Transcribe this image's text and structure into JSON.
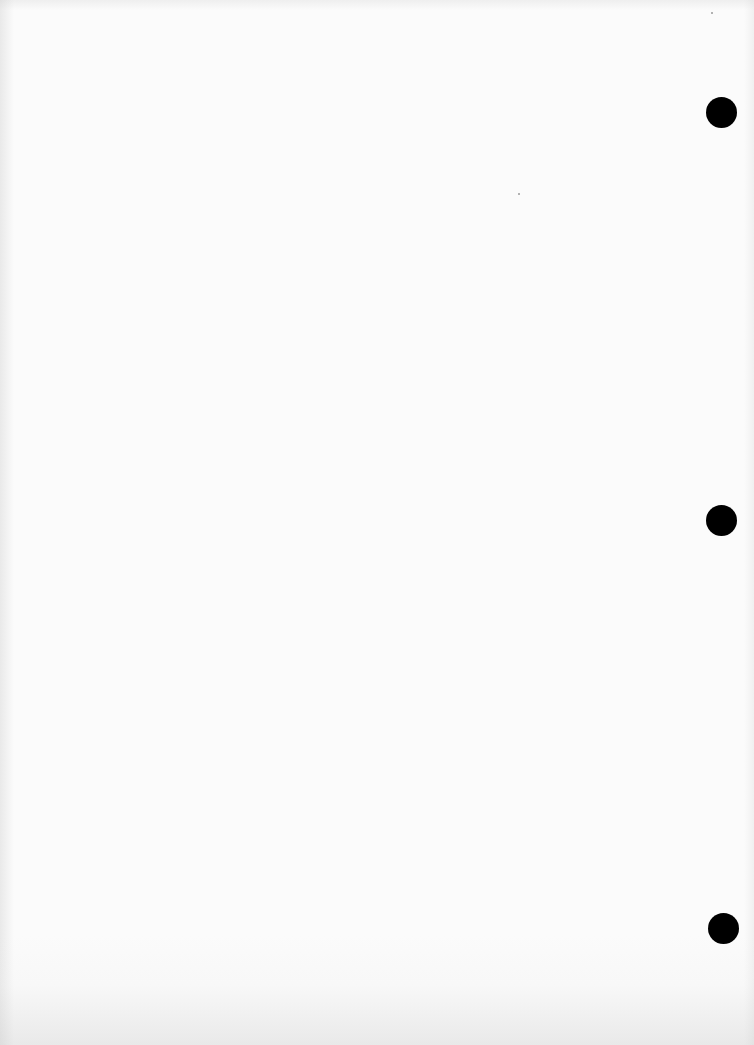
{
  "page": {
    "type": "blank scanned sheet",
    "background_color": "#fbfbfb",
    "text": ""
  },
  "punch_holes": [
    {
      "cx": 721,
      "cy": 112,
      "r": 15,
      "color": "#000000"
    },
    {
      "cx": 721,
      "cy": 520,
      "r": 15,
      "color": "#000000"
    },
    {
      "cx": 723,
      "cy": 928,
      "r": 15,
      "color": "#000000"
    }
  ]
}
